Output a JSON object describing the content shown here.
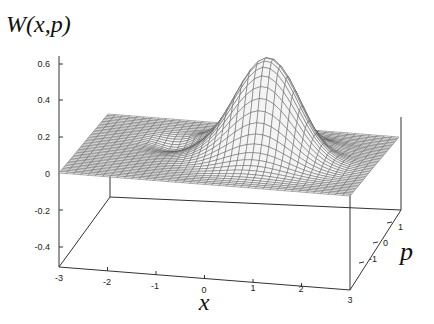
{
  "chart_data": {
    "type": "surface3d",
    "title": "",
    "zlabel": "W(x,p)",
    "xlabel": "x",
    "ylabel": "p",
    "x_ticks": [
      "-3",
      "-2",
      "-1",
      "0",
      "1",
      "2",
      "3"
    ],
    "p_ticks": [
      "-1",
      "0",
      "1"
    ],
    "z_ticks": [
      "0.6",
      "0.4",
      "0.2",
      "0",
      "-0.2",
      "-0.4"
    ],
    "xlim": [
      -3,
      3
    ],
    "plim": [
      -1.5,
      1.5
    ],
    "zlim": [
      -0.5,
      0.6
    ],
    "surface": {
      "description": "Wigner function with a central positive peak (~0.55) near x=0.8, p=0 and two small negative dips on either side along x",
      "peak": {
        "x": 0.8,
        "p": 0.0,
        "z": 0.55
      },
      "dips": [
        {
          "x": -1.2,
          "p": 0.4,
          "z": -0.05
        },
        {
          "x": 1.8,
          "p": 0.3,
          "z": -0.05
        }
      ],
      "baseline": 0.0,
      "grid_style": "wireframe mesh, gray"
    },
    "grid": false,
    "legend": null
  },
  "colors": {
    "mesh": "#555555",
    "surface_fill": "#bdbdbd",
    "axis": "#333333"
  }
}
